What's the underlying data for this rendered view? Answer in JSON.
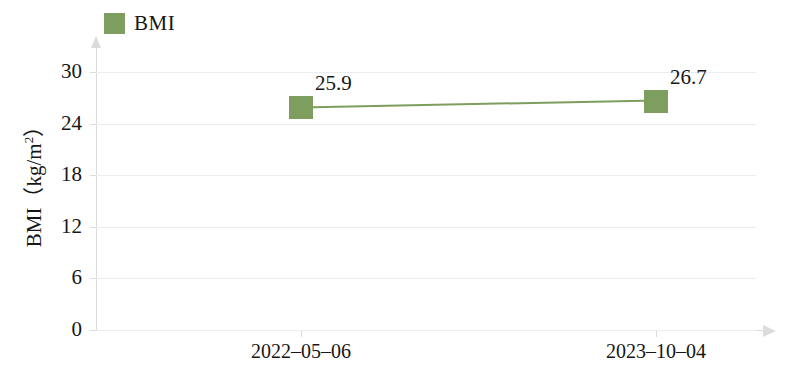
{
  "chart_data": {
    "type": "line",
    "title": "",
    "xlabel": "",
    "ylabel": "BMI（kg/m²）",
    "ylabel_base": "BMI（kg/m",
    "ylabel_exp": "2",
    "ylabel_tail": "）",
    "categories": [
      "2022–05–06",
      "2023–10–04"
    ],
    "series": [
      {
        "name": "BMI",
        "values": [
          25.9,
          26.7
        ],
        "color": "#7d9e5e",
        "marker": "square",
        "point_labels": [
          "25.9",
          "26.7"
        ]
      }
    ],
    "ylim": [
      0,
      32
    ],
    "yticks": [
      0,
      6,
      12,
      18,
      24,
      30
    ],
    "ytick_labels": [
      "0",
      "6",
      "12",
      "18",
      "24",
      "30"
    ],
    "grid": true,
    "grid_color": "#e8edf0",
    "axis_color": "#dcdcdc",
    "legend_position": "top-left"
  },
  "legend": {
    "entries": [
      {
        "label": "BMI",
        "color": "#7d9e5e"
      }
    ]
  }
}
